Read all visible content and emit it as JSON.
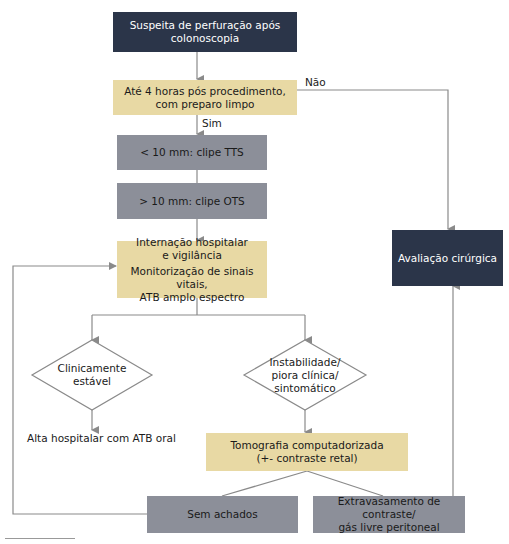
{
  "diagram": {
    "colors": {
      "dark_box": "#2b3549",
      "yellow_box": "#e8d9a4",
      "gray_box": "#8c8f99",
      "connector": "#8a8a8a"
    },
    "nodes": {
      "start": {
        "lines": [
          "Suspeita de perfuração após",
          "colonoscopia"
        ]
      },
      "time_check": {
        "lines": [
          "Até 4 horas pós procedimento,",
          "com preparo limpo"
        ]
      },
      "clip_tts": {
        "text": "< 10 mm: clipe TTS"
      },
      "clip_ots": {
        "text": "> 10 mm: clipe OTS"
      },
      "admission": {
        "lines": [
          "Internação hospitalar",
          "e vigilância",
          "Monitorização de sinais vitais,",
          "ATB amplo espectro"
        ]
      },
      "surgical_eval": {
        "text": "Avaliação cirúrgica"
      },
      "stable": {
        "lines": [
          "Clinicamente",
          "estável"
        ]
      },
      "unstable": {
        "lines": [
          "Instabilidade/",
          "piora clínica/",
          "sintomático"
        ]
      },
      "discharge": {
        "text": "Alta hospitalar com ATB oral"
      },
      "ct_scan": {
        "lines": [
          "Tomografia computadorizada",
          "(+- contraste retal)"
        ]
      },
      "no_findings": {
        "text": "Sem achados"
      },
      "leak": {
        "lines": [
          "Extravasamento de contraste/",
          "gás livre peritoneal"
        ]
      }
    },
    "edge_labels": {
      "yes": "Sim",
      "no": "Não"
    }
  }
}
